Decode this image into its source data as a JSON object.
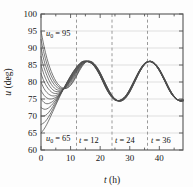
{
  "figure": {
    "background": "#fdfdfd",
    "frame_color": "#555555"
  },
  "axes": {
    "x_label": "t (h)",
    "x_label_var": "t",
    "x_label_unit": "(h)",
    "y_label": "u (deg)",
    "y_label_var": "u",
    "y_label_unit": "(deg)",
    "x_ticks": [
      "0",
      "10",
      "20",
      "30",
      "40"
    ],
    "y_ticks": [
      "60",
      "65",
      "70",
      "75",
      "80",
      "85",
      "90",
      "95",
      "100"
    ]
  },
  "annotations": [
    {
      "id": "u0-high",
      "var": "u",
      "sub": "0",
      "eq": " = ",
      "value": "95",
      "text": "u0 = 95"
    },
    {
      "id": "u0-low",
      "var": "u",
      "sub": "0",
      "eq": " = ",
      "value": "65",
      "text": "u0 = 65"
    },
    {
      "id": "t12",
      "var": "t",
      "eq": " = ",
      "value": "12",
      "text": "t = 12"
    },
    {
      "id": "t24",
      "var": "t",
      "eq": " = ",
      "value": "24",
      "text": "t = 24"
    },
    {
      "id": "t36",
      "var": "t",
      "eq": " = ",
      "value": "36",
      "text": "t = 36"
    }
  ],
  "chart_data": {
    "type": "line",
    "title": "",
    "xlabel": "t (h)",
    "ylabel": "u (deg)",
    "xlim": [
      0,
      48
    ],
    "ylim": [
      60,
      100
    ],
    "xticks": [
      0,
      10,
      20,
      30,
      40
    ],
    "yticks": [
      60,
      65,
      70,
      75,
      80,
      85,
      90,
      95,
      100
    ],
    "grid": "horizontal-gridlines-at-yticks",
    "legend": "none",
    "line_color": "#4d4d4d",
    "vlines": [
      {
        "x": 12,
        "label": "t = 12",
        "style": "dashed",
        "color": "#9a9a9a"
      },
      {
        "x": 24,
        "label": "t = 24",
        "style": "dashed",
        "color": "#9a9a9a"
      },
      {
        "x": 36,
        "label": "t = 36",
        "style": "dashed",
        "color": "#9a9a9a"
      }
    ],
    "x": [
      0,
      1,
      2,
      3,
      4,
      5,
      6,
      7,
      8,
      9,
      10,
      11,
      12,
      13,
      14,
      15,
      16,
      17,
      18,
      19,
      20,
      21,
      22,
      23,
      24,
      25,
      26,
      27,
      28,
      29,
      30,
      31,
      32,
      33,
      34,
      35,
      36,
      37,
      38,
      39,
      40,
      41,
      42,
      43,
      44,
      45,
      46,
      47,
      48
    ],
    "attractor": [
      75.2,
      73.6,
      72.8,
      72.6,
      73.0,
      73.8,
      74.9,
      76.3,
      78.0,
      79.8,
      81.5,
      83.2,
      84.5,
      85.5,
      86.0,
      86.1,
      85.8,
      85.0,
      83.9,
      82.4,
      80.7,
      78.9,
      77.2,
      75.7,
      74.6,
      74.0,
      73.9,
      74.3,
      75.2,
      76.5,
      78.2,
      80.0,
      81.8,
      83.4,
      84.8,
      85.7,
      86.1,
      86.0,
      85.4,
      84.3,
      82.9,
      81.2,
      79.4,
      77.6,
      76.1,
      75.0,
      74.3,
      74.1,
      74.4
    ],
    "series": [
      {
        "name": "u0 = 95",
        "u0": 95,
        "values": [
          95.0,
          90.6,
          87.0,
          84.2,
          82.0,
          80.3,
          79.1,
          78.4,
          78.1,
          78.3,
          79.0,
          80.2,
          81.7,
          83.3,
          84.7,
          85.7,
          86.1,
          86.0,
          85.4,
          84.3,
          82.8,
          81.0,
          79.2,
          77.5,
          76.1,
          75.1,
          74.5,
          74.4,
          74.8,
          75.7,
          77.0,
          78.7,
          80.5,
          82.3,
          83.9,
          85.1,
          85.9,
          86.1,
          85.8,
          85.0,
          83.8,
          82.2,
          80.5,
          78.7,
          77.1,
          75.8,
          74.9,
          74.4,
          74.4
        ]
      },
      {
        "name": "u0 = 92.5",
        "u0": 92.5,
        "values": [
          92.5,
          88.5,
          85.3,
          82.8,
          80.9,
          79.5,
          78.6,
          78.1,
          78.0,
          78.4,
          79.2,
          80.5,
          82.0,
          83.6,
          85.0,
          85.8,
          86.1,
          86.0,
          85.3,
          84.2,
          82.7,
          80.9,
          79.1,
          77.4,
          76.0,
          75.0,
          74.5,
          74.4,
          74.8,
          75.8,
          77.1,
          78.8,
          80.6,
          82.4,
          83.9,
          85.1,
          85.9,
          86.1,
          85.8,
          85.0,
          83.8,
          82.2,
          80.5,
          78.7,
          77.1,
          75.8,
          74.9,
          74.4,
          74.4
        ]
      },
      {
        "name": "u0 = 90",
        "u0": 90,
        "values": [
          90.0,
          86.4,
          83.6,
          81.4,
          79.8,
          78.7,
          78.1,
          77.9,
          78.1,
          78.7,
          79.7,
          81.0,
          82.4,
          83.9,
          85.1,
          85.9,
          86.1,
          85.9,
          85.2,
          84.1,
          82.6,
          80.8,
          79.0,
          77.3,
          75.9,
          75.0,
          74.5,
          74.4,
          74.9,
          75.8,
          77.2,
          78.9,
          80.7,
          82.5,
          84.0,
          85.2,
          85.9,
          86.1,
          85.7,
          84.9,
          83.7,
          82.1,
          80.4,
          78.6,
          77.0,
          75.8,
          74.9,
          74.4,
          74.5
        ]
      },
      {
        "name": "u0 = 87.5",
        "u0": 87.5,
        "values": [
          87.5,
          84.3,
          81.9,
          80.0,
          78.7,
          77.9,
          77.6,
          77.7,
          78.2,
          79.0,
          80.1,
          81.4,
          82.8,
          84.2,
          85.3,
          86.0,
          86.1,
          85.8,
          85.1,
          84.0,
          82.5,
          80.7,
          78.9,
          77.2,
          75.9,
          74.9,
          74.5,
          74.5,
          74.9,
          75.9,
          77.3,
          79.0,
          80.8,
          82.5,
          84.0,
          85.2,
          85.9,
          86.1,
          85.7,
          84.9,
          83.7,
          82.1,
          80.4,
          78.6,
          77.0,
          75.8,
          74.9,
          74.4,
          74.5
        ]
      },
      {
        "name": "u0 = 85",
        "u0": 85,
        "values": [
          85.0,
          82.2,
          80.2,
          78.7,
          77.7,
          77.2,
          77.2,
          77.5,
          78.2,
          79.2,
          80.4,
          81.7,
          83.1,
          84.4,
          85.4,
          86.0,
          86.1,
          85.8,
          85.1,
          83.9,
          82.4,
          80.6,
          78.8,
          77.2,
          75.8,
          74.9,
          74.5,
          74.5,
          75.0,
          76.0,
          77.4,
          79.1,
          80.9,
          82.6,
          84.1,
          85.3,
          85.9,
          86.1,
          85.7,
          84.9,
          83.6,
          82.0,
          80.3,
          78.5,
          76.9,
          75.7,
          74.9,
          74.5,
          74.5
        ]
      },
      {
        "name": "u0 = 82.5",
        "u0": 82.5,
        "values": [
          82.5,
          80.2,
          78.6,
          77.5,
          76.8,
          76.6,
          76.8,
          77.4,
          78.2,
          79.3,
          80.6,
          82.0,
          83.3,
          84.6,
          85.5,
          86.0,
          86.1,
          85.8,
          85.0,
          83.8,
          82.3,
          80.5,
          78.7,
          77.1,
          75.8,
          74.9,
          74.5,
          74.5,
          75.0,
          76.0,
          77.4,
          79.1,
          80.9,
          82.6,
          84.1,
          85.3,
          85.9,
          86.0,
          85.7,
          84.8,
          83.6,
          82.0,
          80.3,
          78.5,
          76.9,
          75.7,
          74.9,
          74.5,
          74.6
        ]
      },
      {
        "name": "u0 = 80",
        "u0": 80,
        "values": [
          80.0,
          78.1,
          76.9,
          76.2,
          75.9,
          76.0,
          76.5,
          77.3,
          78.3,
          79.5,
          80.8,
          82.2,
          83.5,
          84.7,
          85.6,
          86.0,
          86.0,
          85.7,
          85.0,
          83.8,
          82.2,
          80.4,
          78.6,
          77.0,
          75.7,
          74.8,
          74.5,
          74.6,
          75.1,
          76.1,
          77.5,
          79.2,
          81.0,
          82.7,
          84.2,
          85.3,
          85.9,
          86.0,
          85.6,
          84.8,
          83.5,
          81.9,
          80.2,
          78.4,
          76.9,
          75.7,
          74.9,
          74.5,
          74.6
        ]
      },
      {
        "name": "u0 = 77.5",
        "u0": 77.5,
        "values": [
          77.5,
          76.1,
          75.3,
          75.0,
          75.1,
          75.5,
          76.2,
          77.2,
          78.3,
          79.6,
          81.0,
          82.4,
          83.7,
          84.8,
          85.7,
          86.1,
          86.0,
          85.7,
          84.9,
          83.7,
          82.1,
          80.3,
          78.5,
          76.9,
          75.7,
          74.8,
          74.5,
          74.6,
          75.1,
          76.1,
          77.5,
          79.2,
          81.0,
          82.7,
          84.2,
          85.3,
          85.9,
          86.0,
          85.6,
          84.8,
          83.5,
          81.9,
          80.2,
          78.4,
          76.8,
          75.6,
          74.9,
          74.5,
          74.6
        ]
      },
      {
        "name": "u0 = 75",
        "u0": 75,
        "values": [
          75.0,
          74.0,
          73.6,
          73.8,
          74.3,
          75.1,
          76.1,
          77.2,
          78.5,
          79.8,
          81.2,
          82.6,
          83.9,
          85.0,
          85.8,
          86.1,
          86.0,
          85.6,
          84.8,
          83.6,
          82.0,
          80.2,
          78.4,
          76.8,
          75.6,
          74.8,
          74.5,
          74.6,
          75.2,
          76.2,
          77.6,
          79.3,
          81.1,
          82.8,
          84.2,
          85.4,
          85.9,
          86.0,
          85.6,
          84.7,
          83.4,
          81.8,
          80.1,
          78.3,
          76.8,
          75.6,
          74.9,
          74.6,
          74.7
        ]
      },
      {
        "name": "u0 = 72.5",
        "u0": 72.5,
        "values": [
          72.5,
          72.0,
          72.1,
          72.7,
          73.6,
          74.7,
          75.9,
          77.2,
          78.6,
          80.0,
          81.4,
          82.8,
          84.0,
          85.1,
          85.9,
          86.1,
          86.0,
          85.6,
          84.8,
          83.5,
          82.0,
          80.1,
          78.3,
          76.8,
          75.6,
          74.8,
          74.5,
          74.7,
          75.2,
          76.2,
          77.7,
          79.4,
          81.1,
          82.8,
          84.3,
          85.4,
          85.9,
          86.0,
          85.6,
          84.7,
          83.4,
          81.8,
          80.1,
          78.3,
          76.7,
          75.6,
          74.9,
          74.6,
          74.7
        ]
      },
      {
        "name": "u0 = 70",
        "u0": 70,
        "values": [
          70.0,
          70.0,
          70.5,
          71.5,
          72.8,
          74.2,
          75.7,
          77.1,
          78.6,
          80.1,
          81.6,
          83.0,
          84.2,
          85.2,
          86.0,
          86.1,
          86.0,
          85.6,
          84.7,
          83.5,
          81.9,
          80.1,
          78.2,
          76.7,
          75.5,
          74.7,
          74.5,
          74.7,
          75.3,
          76.3,
          77.7,
          79.4,
          81.2,
          82.9,
          84.3,
          85.4,
          85.9,
          86.0,
          85.5,
          84.7,
          83.4,
          81.8,
          80.0,
          78.2,
          76.7,
          75.5,
          74.8,
          74.6,
          74.7
        ]
      },
      {
        "name": "u0 = 67.5",
        "u0": 67.5,
        "values": [
          67.5,
          68.0,
          69.0,
          70.4,
          72.0,
          73.7,
          75.4,
          77.0,
          78.6,
          80.2,
          81.7,
          83.1,
          84.3,
          85.3,
          86.0,
          86.1,
          85.9,
          85.5,
          84.7,
          83.4,
          81.8,
          80.0,
          78.2,
          76.6,
          75.5,
          74.7,
          74.5,
          74.7,
          75.3,
          76.4,
          77.8,
          79.5,
          81.2,
          82.9,
          84.4,
          85.5,
          86.0,
          86.0,
          85.5,
          84.6,
          83.3,
          81.7,
          80.0,
          78.2,
          76.6,
          75.5,
          74.8,
          74.6,
          74.8
        ]
      },
      {
        "name": "u0 = 65",
        "u0": 65,
        "values": [
          65.0,
          66.1,
          67.6,
          69.4,
          71.3,
          73.2,
          75.1,
          76.9,
          78.6,
          80.3,
          81.8,
          83.2,
          84.4,
          85.4,
          86.0,
          86.1,
          85.9,
          85.5,
          84.6,
          83.3,
          81.8,
          79.9,
          78.1,
          76.6,
          75.4,
          74.7,
          74.5,
          74.8,
          75.4,
          76.4,
          77.9,
          79.6,
          81.3,
          83.0,
          84.4,
          85.5,
          86.0,
          86.0,
          85.5,
          84.6,
          83.3,
          81.7,
          79.9,
          78.1,
          76.6,
          75.5,
          74.8,
          74.6,
          74.8
        ]
      }
    ]
  }
}
